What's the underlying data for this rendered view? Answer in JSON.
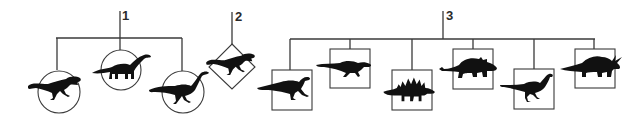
{
  "diagram": {
    "type": "classification-tree",
    "colors": {
      "line": "#3a3a3a",
      "silhouette": "#111111",
      "background": "#ffffff"
    },
    "groups": [
      {
        "label": "1",
        "frame_shape": "circle",
        "members": [
          {
            "name": "theropod-silhouette"
          },
          {
            "name": "sauropod-silhouette"
          },
          {
            "name": "prosauropod-silhouette"
          }
        ]
      },
      {
        "label": "2",
        "frame_shape": "diamond",
        "members": [
          {
            "name": "theropod-silhouette"
          }
        ]
      },
      {
        "label": "3",
        "frame_shape": "square",
        "members": [
          {
            "name": "iguanodont-silhouette"
          },
          {
            "name": "pachycephalosaur-silhouette"
          },
          {
            "name": "stegosaur-silhouette"
          },
          {
            "name": "ankylosaur-silhouette"
          },
          {
            "name": "ornithopod-silhouette"
          },
          {
            "name": "ceratopsian-silhouette"
          }
        ]
      }
    ]
  }
}
